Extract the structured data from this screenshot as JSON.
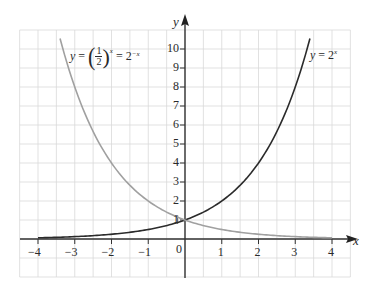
{
  "chart_data": {
    "type": "line",
    "title": "",
    "xlabel": "x",
    "ylabel": "y",
    "xlim": [
      -4.5,
      4.5
    ],
    "ylim": [
      -2,
      11
    ],
    "grid": true,
    "x_ticks": [
      -4,
      -3,
      -2,
      -1,
      0,
      1,
      2,
      3,
      4
    ],
    "x_tick_labels": [
      "−4",
      "−3",
      "−2",
      "−1",
      "0",
      "1",
      "2",
      "3",
      "4"
    ],
    "y_ticks": [
      1,
      2,
      3,
      4,
      5,
      6,
      7,
      8,
      9,
      10
    ],
    "y_tick_labels": [
      "1",
      "2",
      "3",
      "4",
      "5",
      "6",
      "7",
      "8",
      "9",
      "10"
    ],
    "series": [
      {
        "name": "y = 2^x",
        "label_text": "y = 2",
        "label_sup": "x",
        "color": "#2b2b2b",
        "x_range": [
          -4,
          3.4
        ],
        "x": [
          -4,
          -3,
          -2,
          -1,
          0,
          1,
          2,
          3,
          3.4
        ],
        "values": [
          0.0625,
          0.125,
          0.25,
          0.5,
          1,
          2,
          4,
          8,
          10.56
        ]
      },
      {
        "name": "y = (1/2)^x = 2^-x",
        "label_text": "y = (1/2)^x = 2^-x",
        "color": "#a0a0a0",
        "x_range": [
          -3.4,
          4
        ],
        "x": [
          -3.4,
          -3,
          -2,
          -1,
          0,
          1,
          2,
          3,
          4
        ],
        "values": [
          10.56,
          8,
          4,
          2,
          1,
          0.5,
          0.25,
          0.125,
          0.0625
        ]
      }
    ],
    "annotations": [
      {
        "text": "y = (1/2)^x = 2^-x",
        "near_series": "y = (1/2)^x = 2^-x",
        "position": "top-left"
      },
      {
        "text": "y = 2^x",
        "near_series": "y = 2^x",
        "position": "top-right"
      }
    ],
    "intersection": {
      "x": 0,
      "y": 1
    }
  },
  "labels": {
    "x_axis": "x",
    "y_axis": "y",
    "left_curve": {
      "y": "y",
      "eq": "=",
      "num": "1",
      "den": "2",
      "exp": "x",
      "eq2": "= 2",
      "exp2": "−x"
    },
    "right_curve": {
      "y": "y",
      "eq": "= 2",
      "exp": "x"
    }
  }
}
